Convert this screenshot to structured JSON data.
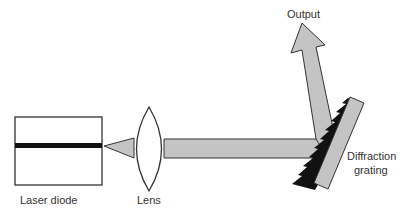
{
  "diagram": {
    "components": {
      "laser_diode": {
        "label": "Laser diode"
      },
      "lens": {
        "label": "Lens"
      },
      "grating": {
        "label_line1": "Diffraction",
        "label_line2": "grating"
      },
      "output": {
        "label": "Output"
      }
    },
    "colors": {
      "beam_fill": "#c4c4c4",
      "outline": "#333333",
      "active_region": "#111111",
      "grating_teeth": "#111111",
      "lens_fill": "#ffffff"
    }
  }
}
